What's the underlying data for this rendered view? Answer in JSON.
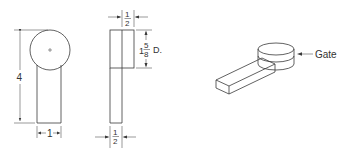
{
  "diagram": {
    "type": "engineering-drawing",
    "front_view": {
      "height_dim": "4",
      "width_dim": "1"
    },
    "side_view": {
      "top_width_dim_num": "1",
      "top_width_dim_den": "2",
      "bottom_width_dim_num": "1",
      "bottom_width_dim_den": "2",
      "diameter_whole": "1",
      "diameter_num": "5",
      "diameter_den": "8",
      "diameter_suffix": "D."
    },
    "isometric_view": {
      "label": "Gate"
    },
    "colors": {
      "line": "#3a3a3a",
      "background": "#ffffff"
    }
  }
}
